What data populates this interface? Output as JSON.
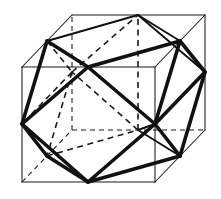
{
  "figure": {
    "background_color": "#ffffff",
    "line_color": "#111111",
    "cube_line_color": "#1a1a1a",
    "projection": "oblique parallel projection, depth offset (+50, -52) px"
  },
  "geometry": {
    "cube": {
      "name": "outer-cube",
      "front_face": {
        "top_left": [
          22,
          67
        ],
        "top_right": [
          155,
          67
        ],
        "bottom_right": [
          155,
          182
        ],
        "bottom_left": [
          22,
          182
        ]
      },
      "back_face": {
        "top_left": [
          72,
          15
        ],
        "top_right": [
          205,
          15
        ],
        "bottom_right": [
          205,
          130
        ],
        "bottom_left": [
          72,
          130
        ]
      },
      "visible_edges": [
        [
          [
            22,
            67
          ],
          [
            155,
            67
          ]
        ],
        [
          [
            155,
            67
          ],
          [
            155,
            182
          ]
        ],
        [
          [
            155,
            182
          ],
          [
            22,
            182
          ]
        ],
        [
          [
            22,
            182
          ],
          [
            22,
            67
          ]
        ],
        [
          [
            22,
            67
          ],
          [
            72,
            15
          ]
        ],
        [
          [
            72,
            15
          ],
          [
            205,
            15
          ]
        ],
        [
          [
            205,
            15
          ],
          [
            155,
            67
          ]
        ],
        [
          [
            205,
            15
          ],
          [
            205,
            130
          ]
        ],
        [
          [
            205,
            130
          ],
          [
            155,
            182
          ]
        ]
      ],
      "hidden_edges": [
        [
          [
            22,
            182
          ],
          [
            72,
            130
          ]
        ],
        [
          [
            72,
            130
          ],
          [
            205,
            130
          ]
        ],
        [
          [
            72,
            130
          ],
          [
            72,
            15
          ]
        ]
      ]
    },
    "cuboctahedron": {
      "name": "inscribed-cuboctahedron",
      "vertex_labels": [
        "TF",
        "TB",
        "TL",
        "TR",
        "BF",
        "BB",
        "BL",
        "BR",
        "FL",
        "FR",
        "KL",
        "KR"
      ],
      "vertices": {
        "TF": [
          88,
          67
        ],
        "TB": [
          138,
          15
        ],
        "TL": [
          47,
          41
        ],
        "TR": [
          180,
          41
        ],
        "BF": [
          88,
          182
        ],
        "BB": [
          138,
          130
        ],
        "BL": [
          47,
          156
        ],
        "BR": [
          180,
          156
        ],
        "FL": [
          22,
          124
        ],
        "FR": [
          155,
          124
        ],
        "KL": [
          72,
          72
        ],
        "KR": [
          205,
          72
        ]
      },
      "visible_edges": [
        [
          "TF",
          "TL"
        ],
        [
          "TF",
          "TR"
        ],
        [
          "TL",
          "TB"
        ],
        [
          "TB",
          "TR"
        ],
        [
          "TF",
          "FL"
        ],
        [
          "TF",
          "FR"
        ],
        [
          "TL",
          "FL"
        ],
        [
          "TR",
          "FR"
        ],
        [
          "TR",
          "KR"
        ],
        [
          "TB",
          "KR"
        ],
        [
          "BF",
          "BL"
        ],
        [
          "BF",
          "BR"
        ],
        [
          "BL",
          "FL"
        ],
        [
          "BR",
          "FR"
        ],
        [
          "BF",
          "FL"
        ],
        [
          "BF",
          "FR"
        ],
        [
          "BR",
          "KR"
        ],
        [
          "FR",
          "BB"
        ],
        [
          "BB",
          "BR"
        ],
        [
          "FR",
          "KR"
        ]
      ],
      "hidden_edges": [
        [
          "TL",
          "KL"
        ],
        [
          "KL",
          "TB"
        ],
        [
          "KL",
          "FL"
        ],
        [
          "KL",
          "BL"
        ],
        [
          "BL",
          "BB"
        ],
        [
          "BB",
          "TB"
        ],
        [
          "BB",
          "KL"
        ]
      ],
      "face_count": 14,
      "square_face_count": 6,
      "triangle_face_count": 8,
      "edge_count": 24,
      "vertex_count": 12
    }
  }
}
